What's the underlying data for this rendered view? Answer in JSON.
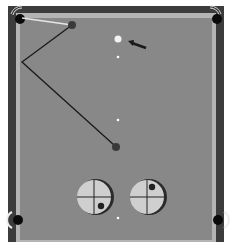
{
  "scene": {
    "title": "Billiards shot diagram",
    "colors": {
      "background": "#ffffff",
      "rail": "#3c3c3c",
      "cushion": "#b4b4b4",
      "felt": "#888888",
      "pocket": "#0a0a0a",
      "object_ball": "#3a3a3a",
      "cue_ball": "#f2f2f2",
      "aim_line": "#1a1a1a",
      "cue_path": "#e6e6e6",
      "diamond": "#ffffff",
      "spin_face": "#cfcfcf",
      "spin_shadow": "#2a2a2a",
      "spin_dot": "#222222"
    }
  },
  "balls": {
    "object_ball_1": {
      "label": "object ball near top cushion",
      "x": 72,
      "y": 25,
      "r": 4
    },
    "object_ball_2": {
      "label": "object ball center table",
      "x": 116,
      "y": 147,
      "r": 4
    },
    "cue_ball": {
      "label": "cue ball",
      "x": 118,
      "y": 39,
      "r": 3.5
    }
  },
  "arrow": {
    "label": "direction arrow",
    "x1": 146,
    "y1": 48,
    "x2": 129,
    "y2": 42
  },
  "paths": {
    "white_path": {
      "label": "path to corner pocket",
      "points": [
        [
          72,
          25
        ],
        [
          22,
          18
        ]
      ]
    },
    "black_path": {
      "label": "bank shot path",
      "points": [
        [
          72,
          25
        ],
        [
          22,
          62
        ],
        [
          114,
          145
        ]
      ]
    }
  },
  "diamonds": [
    {
      "x": 118,
      "y": 57
    },
    {
      "x": 118,
      "y": 120
    },
    {
      "x": 118,
      "y": 218
    }
  ],
  "pockets": [
    {
      "name": "top-left",
      "x": 20,
      "y": 19
    },
    {
      "name": "top-right",
      "x": 217,
      "y": 19
    },
    {
      "name": "side-left",
      "x": 18,
      "y": 220
    },
    {
      "name": "side-right",
      "x": 218,
      "y": 220
    }
  ],
  "spin_indicators": [
    {
      "label": "spin left",
      "cx": 94,
      "cy": 197,
      "r": 18,
      "dot_x": 101,
      "dot_y": 206
    },
    {
      "label": "spin right",
      "cx": 147,
      "cy": 197,
      "r": 18,
      "dot_x": 152,
      "dot_y": 187
    }
  ]
}
